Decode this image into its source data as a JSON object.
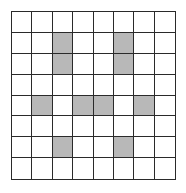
{
  "grid": {
    "rows": 8,
    "cols": 8,
    "shade_color": "#b8b8b8",
    "line_color": "#2a2a2a",
    "background": "#ffffff",
    "shaded_cells": [
      [
        1,
        2
      ],
      [
        1,
        5
      ],
      [
        2,
        2
      ],
      [
        2,
        5
      ],
      [
        4,
        1
      ],
      [
        4,
        3
      ],
      [
        4,
        4
      ],
      [
        4,
        6
      ],
      [
        6,
        2
      ],
      [
        6,
        5
      ]
    ]
  }
}
